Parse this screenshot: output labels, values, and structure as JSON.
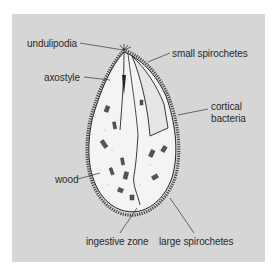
{
  "diagram": {
    "background_color": "#d6d6d6",
    "labels": {
      "undulipodia": "undulipodia",
      "small_spirochetes": "small spirochetes",
      "axostyle": "axostyle",
      "cortical_bacteria_line1": "cortical",
      "cortical_bacteria_line2": "bacteria",
      "wood": "wood",
      "ingestive_zone": "ingestive zone",
      "large_spirochetes": "large spirochetes"
    }
  }
}
